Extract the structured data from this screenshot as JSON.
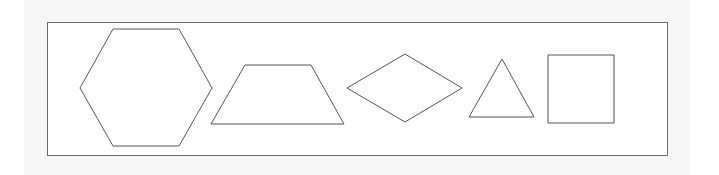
{
  "diagram": {
    "background": "#ffffff",
    "page_band_color": "#f7f7f7",
    "frame": {
      "x": 47,
      "y": 22,
      "width": 620,
      "height": 133,
      "stroke": "#6b6b6b",
      "fill": "#ffffff"
    },
    "stroke_color": "#555555",
    "shapes": [
      {
        "name": "hexagon",
        "points": "80,88 113,29 179,29 212,88 179,146 113,146"
      },
      {
        "name": "trapezoid",
        "points": "245,65 311,65 344,124 211,124"
      },
      {
        "name": "rhombus",
        "points": "347,88 405,54 462,88 405,122"
      },
      {
        "name": "triangle",
        "points": "502,59 534,117 469,117"
      },
      {
        "name": "square",
        "points": "548,55 614,55 614,123 548,123"
      }
    ]
  }
}
